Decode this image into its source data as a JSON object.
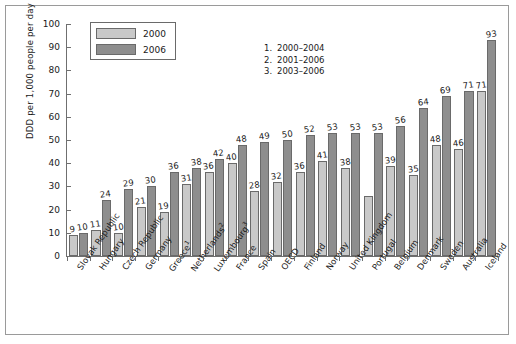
{
  "chart_data": {
    "type": "bar",
    "title": "",
    "xlabel": "",
    "ylabel": "DDD per 1,000 people per day",
    "ylim": [
      0,
      100
    ],
    "ytick_values": [
      0,
      10,
      20,
      30,
      40,
      50,
      60,
      70,
      80,
      90,
      100
    ],
    "grid": false,
    "legend_position": "top-left",
    "categories": [
      "Slovak Republic",
      "Hungary",
      "Czech Republic",
      "Germany",
      "Greece",
      "Netherlands",
      "Luxembourg",
      "France",
      "Spain",
      "OECD",
      "Finland",
      "Norway",
      "United Kingdom",
      "Portugal",
      "Belgium",
      "Denmark",
      "Sweden",
      "Australia",
      "Iceland"
    ],
    "category_footnotes": [
      "",
      "",
      "",
      "",
      "1",
      "2",
      "3",
      "",
      "",
      "",
      "",
      "",
      "",
      "",
      "",
      "",
      "",
      "",
      ""
    ],
    "series": [
      {
        "name": "2000",
        "color": "#c9c9c9",
        "values": [
          9,
          11,
          10,
          21,
          19,
          31,
          36,
          40,
          28,
          32,
          36,
          41,
          38,
          26,
          39,
          35,
          48,
          46,
          71
        ],
        "labels": [
          "9",
          "11",
          "10",
          "21",
          "19",
          "31",
          "36",
          "40",
          "28",
          "32",
          "36",
          "41",
          "38",
          "",
          "39",
          "35",
          "48",
          "46",
          "71"
        ]
      },
      {
        "name": "2006",
        "color": "#8e8e8e",
        "values": [
          10,
          24,
          29,
          30,
          36,
          38,
          42,
          48,
          49,
          50,
          52,
          53,
          53,
          53,
          56,
          64,
          69,
          71,
          93
        ],
        "labels": [
          "10",
          "24",
          "29",
          "30",
          "36",
          "38",
          "42",
          "48",
          "49",
          "50",
          "52",
          "53",
          "53",
          "53",
          "56",
          "64",
          "69",
          "71",
          "93"
        ]
      }
    ],
    "annotations": [
      {
        "num": "1.",
        "text": "2000–2004"
      },
      {
        "num": "2.",
        "text": "2001–2006"
      },
      {
        "num": "3.",
        "text": "2003–2006"
      }
    ]
  }
}
